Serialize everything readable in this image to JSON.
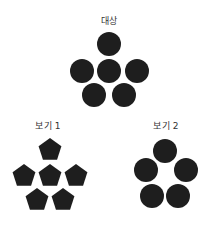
{
  "figure": {
    "shape_color": "#1e1e1e",
    "target": {
      "label": "대상",
      "label_pos": [
        109,
        20
      ],
      "shape": "circle",
      "radius": 12,
      "items": [
        {
          "cx": 109,
          "cy": 44
        },
        {
          "cx": 82,
          "cy": 71
        },
        {
          "cx": 109,
          "cy": 71
        },
        {
          "cx": 137,
          "cy": 71
        },
        {
          "cx": 94,
          "cy": 95
        },
        {
          "cx": 124,
          "cy": 95
        }
      ]
    },
    "options": [
      {
        "label": "보기 1",
        "label_pos": [
          48,
          125
        ],
        "shape": "pentagon",
        "radius": 12,
        "items": [
          {
            "cx": 50,
            "cy": 149
          },
          {
            "cx": 24,
            "cy": 175
          },
          {
            "cx": 50,
            "cy": 175
          },
          {
            "cx": 76,
            "cy": 175
          },
          {
            "cx": 37,
            "cy": 199
          },
          {
            "cx": 63,
            "cy": 199
          }
        ]
      },
      {
        "label": "보기 2",
        "label_pos": [
          166,
          125
        ],
        "shape": "circle",
        "radius": 12,
        "items": [
          {
            "cx": 165,
            "cy": 151
          },
          {
            "cx": 146,
            "cy": 170
          },
          {
            "cx": 186,
            "cy": 170
          },
          {
            "cx": 152,
            "cy": 196
          },
          {
            "cx": 178,
            "cy": 196
          }
        ]
      }
    ]
  }
}
